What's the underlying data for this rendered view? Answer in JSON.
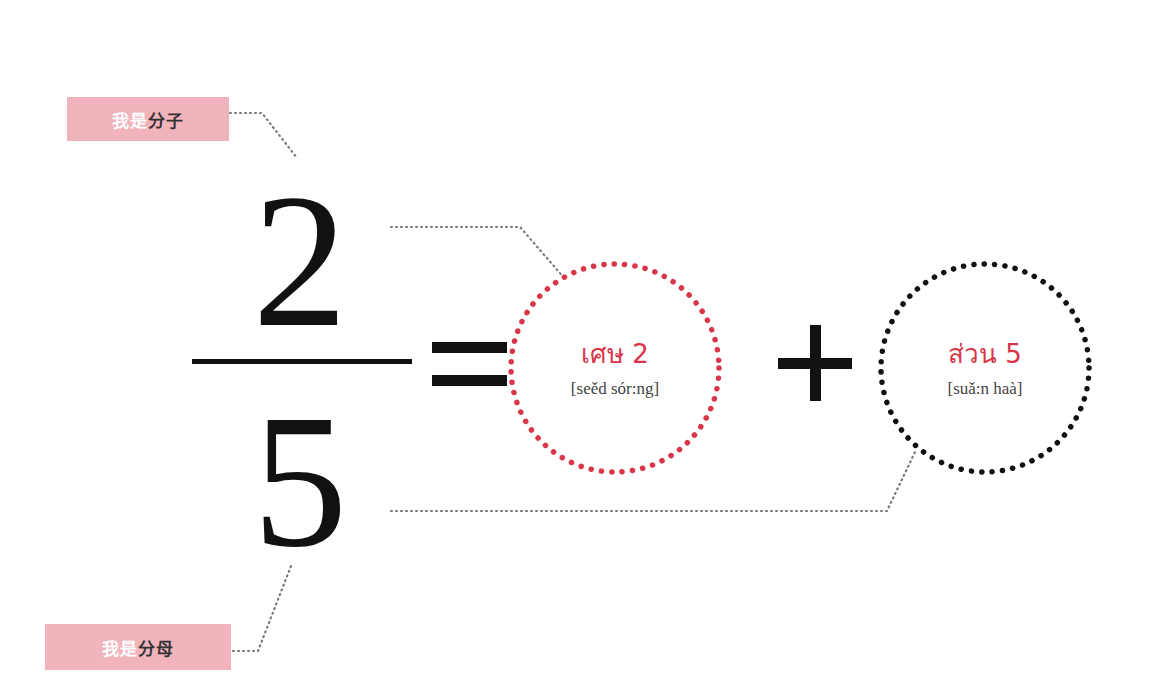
{
  "labels": {
    "numerator": {
      "prefix": "我是",
      "term": "分子"
    },
    "denominator": {
      "prefix": "我是",
      "term": "分母"
    }
  },
  "fraction": {
    "numerator": "2",
    "denominator": "5",
    "equals_symbol": "equals-sign",
    "plus_symbol": "plus-sign"
  },
  "circles": {
    "numerator": {
      "thai": "เศษ 2",
      "romanization": "[seěd sór:ng]",
      "color": "#d9364a"
    },
    "denominator": {
      "thai": "ส่วน 5",
      "romanization": "[suǎ:n haà]",
      "color": "#111111"
    }
  },
  "colors": {
    "label_background": "#f1b3bc",
    "accent_red": "#d9364a",
    "connector_gray": "#777777",
    "ink": "#111111"
  }
}
